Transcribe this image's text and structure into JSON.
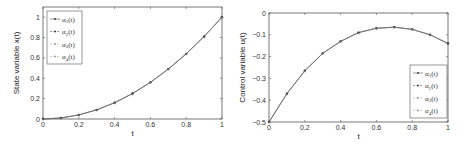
{
  "chart_data": [
    {
      "type": "line",
      "xlabel": "t",
      "ylabel": "State variable x(t)",
      "xlim": [
        0,
        1
      ],
      "ylim": [
        0,
        1.1
      ],
      "xticks": [
        "0",
        "0.2",
        "0.4",
        "0.6",
        "0.8",
        "1"
      ],
      "yticks": [
        "0",
        "0.2",
        "0.4",
        "0.6",
        "0.8",
        "1"
      ],
      "grid": false,
      "legend_position": "upper left",
      "x": [
        0,
        0.1,
        0.2,
        0.3,
        0.4,
        0.5,
        0.6,
        0.7,
        0.8,
        0.9,
        1.0
      ],
      "series": [
        {
          "name": "α1(t)",
          "values": [
            0,
            0.01,
            0.04,
            0.09,
            0.16,
            0.25,
            0.36,
            0.49,
            0.64,
            0.81,
            1.0
          ]
        },
        {
          "name": "α2(t)",
          "values": [
            0,
            0.01,
            0.04,
            0.09,
            0.16,
            0.25,
            0.36,
            0.49,
            0.64,
            0.81,
            1.0
          ]
        },
        {
          "name": "α3(t)",
          "values": [
            0,
            0.01,
            0.04,
            0.09,
            0.16,
            0.25,
            0.36,
            0.49,
            0.64,
            0.81,
            1.0
          ]
        },
        {
          "name": "α4(t)",
          "values": [
            0,
            0.01,
            0.04,
            0.09,
            0.16,
            0.25,
            0.36,
            0.49,
            0.64,
            0.81,
            1.0
          ]
        }
      ]
    },
    {
      "type": "line",
      "xlabel": "t",
      "ylabel": "Control variable u(t)",
      "xlim": [
        0,
        1
      ],
      "ylim": [
        -0.5,
        0
      ],
      "xticks": [
        "0",
        "0.2",
        "0.4",
        "0.6",
        "0.8",
        "1"
      ],
      "yticks": [
        "0",
        "-0.1",
        "-0.2",
        "-0.3",
        "-0.4",
        "-0.5"
      ],
      "grid": false,
      "legend_position": "lower right",
      "x": [
        0,
        0.1,
        0.2,
        0.3,
        0.4,
        0.5,
        0.6,
        0.7,
        0.8,
        0.9,
        1.0
      ],
      "series": [
        {
          "name": "α1(t)",
          "values": [
            -0.5,
            -0.37,
            -0.265,
            -0.185,
            -0.13,
            -0.09,
            -0.07,
            -0.065,
            -0.075,
            -0.1,
            -0.14
          ]
        },
        {
          "name": "α2(t)",
          "values": [
            -0.5,
            -0.37,
            -0.265,
            -0.185,
            -0.13,
            -0.09,
            -0.07,
            -0.065,
            -0.075,
            -0.1,
            -0.14
          ]
        },
        {
          "name": "α3(t)",
          "values": [
            -0.5,
            -0.37,
            -0.265,
            -0.185,
            -0.13,
            -0.09,
            -0.07,
            -0.065,
            -0.075,
            -0.1,
            -0.14
          ]
        },
        {
          "name": "α4(t)",
          "values": [
            -0.5,
            -0.37,
            -0.265,
            -0.185,
            -0.13,
            -0.09,
            -0.07,
            -0.065,
            -0.075,
            -0.1,
            -0.14
          ]
        }
      ]
    }
  ],
  "colors": {
    "axis": "#555555",
    "line": "#666666",
    "marker": "#333333"
  }
}
